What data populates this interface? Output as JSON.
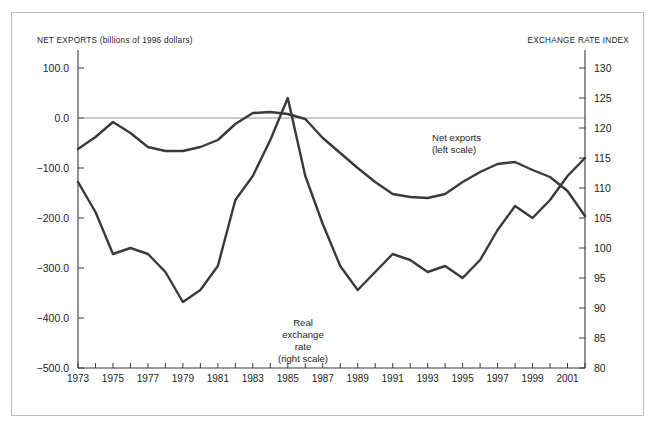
{
  "figure": {
    "left_axis_title": "NET EXPORTS (billions of 1996 dollars)",
    "right_axis_title": "EXCHANGE RATE INDEX",
    "net_exports_label_line1": "Net exports",
    "net_exports_label_line2": "(left scale)",
    "exchange_label_line1": "Real",
    "exchange_label_line2": "exchange",
    "exchange_label_line3": "rate",
    "exchange_label_line4": "(right scale)",
    "line_color": "#3a3a3a",
    "frame_color": "#bdbdbd",
    "zero_line_color": "#8b8b8b"
  },
  "chart_data": {
    "type": "line",
    "title": "",
    "subtitle": "",
    "xlabel": "",
    "ylabel": "NET EXPORTS (billions of 1996 dollars)",
    "y2label": "EXCHANGE RATE INDEX",
    "grid": false,
    "legend": "inline-annotations",
    "x": [
      1973,
      1974,
      1975,
      1976,
      1977,
      1978,
      1979,
      1980,
      1981,
      1982,
      1983,
      1984,
      1985,
      1986,
      1987,
      1988,
      1989,
      1990,
      1991,
      1992,
      1993,
      1994,
      1995,
      1996,
      1997,
      1998,
      1999,
      2000,
      2001,
      2002
    ],
    "xlim": [
      1973,
      2002
    ],
    "xticks": [
      1973,
      1975,
      1977,
      1979,
      1981,
      1983,
      1985,
      1987,
      1989,
      1991,
      1993,
      1995,
      1997,
      1999,
      2001
    ],
    "ylim": [
      -500,
      100
    ],
    "yticks": [
      100.0,
      0.0,
      -100.0,
      -200.0,
      -300.0,
      -400.0,
      -500.0
    ],
    "ytick_labels": [
      "100.0",
      "0.0",
      "−100.0",
      "−200.0",
      "−300.0",
      "−400.0",
      "−500.0"
    ],
    "y2lim": [
      80,
      130
    ],
    "y2ticks": [
      130,
      125,
      120,
      115,
      110,
      105,
      100,
      95,
      90,
      85,
      80
    ],
    "y2tick_labels": [
      "130",
      "125",
      "120",
      "115",
      "110",
      "105",
      "100",
      "95",
      "90",
      "85",
      "80"
    ],
    "series": [
      {
        "name": "Net exports (left scale)",
        "axis": "left",
        "units": "billions of 1996 dollars",
        "values": [
          -62,
          -38,
          -8,
          -30,
          -58,
          -66,
          -66,
          -58,
          -44,
          -12,
          10,
          12,
          8,
          -2,
          -40,
          -70,
          -100,
          -128,
          -152,
          -158,
          -160,
          -152,
          -128,
          -108,
          -92,
          -88,
          -104,
          -118,
          -146,
          -196
        ]
      },
      {
        "name": "Real exchange rate (right scale)",
        "axis": "right",
        "units": "index",
        "values": [
          111,
          106,
          99,
          100,
          99,
          96,
          91,
          93,
          97,
          108,
          112,
          118,
          125,
          112,
          104,
          97,
          93,
          96,
          99,
          98,
          96,
          97,
          95,
          98,
          103,
          107,
          105,
          108,
          112,
          115
        ]
      }
    ],
    "annotations": [
      {
        "text": "Net exports (left scale)",
        "x": 1991,
        "y": -60
      },
      {
        "text": "Real exchange rate (right scale)",
        "x": 1985.5,
        "y": -360
      }
    ]
  }
}
